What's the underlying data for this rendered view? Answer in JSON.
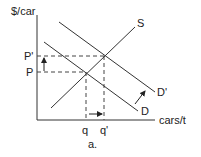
{
  "diagram": {
    "y_axis_label": "$/car",
    "x_axis_label": "cars/t",
    "caption": "a.",
    "curves": {
      "supply": "S",
      "demand": "D",
      "demand_shifted": "D'"
    },
    "price_labels": {
      "initial": "P",
      "new": "P'"
    },
    "quantity_labels": {
      "initial": "q",
      "new": "q'"
    }
  }
}
